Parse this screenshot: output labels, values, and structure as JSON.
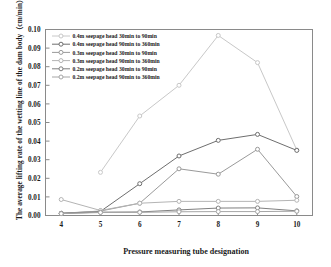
{
  "chart_data": {
    "type": "line",
    "title": "",
    "xlabel": "Pressure measuring tube designation",
    "ylabel": "The average lifting rate of the wetting line of the dam body（cm/min）",
    "x": [
      4,
      5,
      6,
      7,
      8,
      9,
      10
    ],
    "xlim": [
      3.6,
      10.4
    ],
    "ylim": [
      0.0,
      0.1
    ],
    "xticks": [
      "4",
      "5",
      "6",
      "7",
      "8",
      "9",
      "10"
    ],
    "yticks": [
      "0.00",
      "0.01",
      "0.02",
      "0.03",
      "0.04",
      "0.05",
      "0.06",
      "0.07",
      "0.08",
      "0.09",
      "0.10"
    ],
    "grid": false,
    "legend_position": "upper-left",
    "marker": "open-circle",
    "series": [
      {
        "name": "0.4m seepage head 30min to 90min",
        "color": "#c8c8c8",
        "x": [
          5,
          6,
          7,
          8,
          9,
          10
        ],
        "values": [
          0.0232,
          0.0535,
          0.07,
          0.0968,
          0.0822,
          0.0352
        ]
      },
      {
        "name": "0.4m seepage head 90min to 360min",
        "color": "#6e6e6e",
        "x": [
          4,
          5,
          6,
          7,
          8,
          9,
          10
        ],
        "values": [
          0.0012,
          0.0022,
          0.0171,
          0.032,
          0.0404,
          0.0436,
          0.035
        ]
      },
      {
        "name": "0.3m seepage head 30min to 90min",
        "color": "#9a9a9a",
        "x": [
          4,
          5,
          6,
          7,
          8,
          9,
          10
        ],
        "values": [
          0.0012,
          0.0024,
          0.0066,
          0.0251,
          0.0222,
          0.0356,
          0.0102
        ]
      },
      {
        "name": "0.3m seepage head 90min to 360min",
        "color": "#b4b4b4",
        "x": [
          4,
          5,
          6,
          7,
          8,
          9,
          10
        ],
        "values": [
          0.0086,
          0.0027,
          0.0066,
          0.0076,
          0.0076,
          0.0076,
          0.0082
        ]
      },
      {
        "name": "0.2m seepage head 30min to 90min",
        "color": "#7f7f7f",
        "x": [
          4,
          5,
          6,
          7,
          8,
          9,
          10
        ],
        "values": [
          0.0011,
          0.0018,
          0.0019,
          0.003,
          0.004,
          0.0041,
          0.0025
        ]
      },
      {
        "name": "0.2m seepage head 90min to 360min",
        "color": "#a6a6a6",
        "x": [
          4,
          5,
          6,
          7,
          8,
          9,
          10
        ],
        "values": [
          0.001,
          0.0016,
          0.0017,
          0.002,
          0.0021,
          0.0021,
          0.0023
        ]
      }
    ]
  },
  "axes": {
    "frame_color": "#8a8a8a"
  }
}
